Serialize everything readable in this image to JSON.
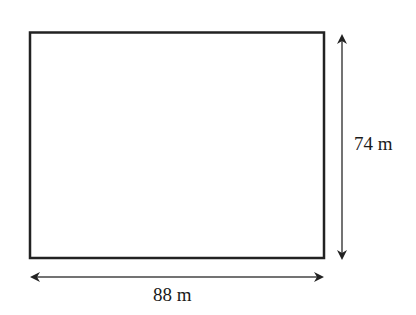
{
  "diagram": {
    "type": "rectangle-dimensions",
    "shape": "rectangle",
    "width_label": "88 m",
    "height_label": "74 m",
    "width_value": 88,
    "height_value": 74,
    "unit": "m",
    "colors": {
      "stroke": "#222222",
      "arrow": "#222222",
      "text": "#1a1a1a",
      "background": "#ffffff"
    }
  }
}
